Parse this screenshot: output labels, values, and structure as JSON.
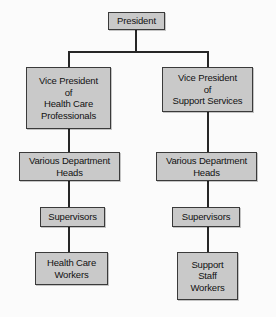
{
  "chart_title": "Organizational Chart",
  "diagram": {
    "type": "org-chart",
    "orientation": "top-down",
    "colors": {
      "background": "#fbfbfb",
      "node_fill": "#c9c9c9",
      "node_border": "#3a3a3a",
      "connector": "#262626",
      "text": "#111111"
    },
    "nodes": {
      "president": {
        "id": "president",
        "level": 0,
        "lines": [
          "President"
        ]
      },
      "vp_health": {
        "id": "vp-health-care-professionals",
        "level": 1,
        "branch": "left",
        "lines": [
          "Vice President",
          "of",
          "Health Care",
          "Professionals"
        ]
      },
      "vp_support": {
        "id": "vp-support-services",
        "level": 1,
        "branch": "right",
        "lines": [
          "Vice President",
          "of",
          "Support Services"
        ]
      },
      "dept_heads_left": {
        "id": "various-department-heads-left",
        "level": 2,
        "branch": "left",
        "lines": [
          "Various Department",
          "Heads"
        ]
      },
      "dept_heads_right": {
        "id": "various-department-heads-right",
        "level": 2,
        "branch": "right",
        "lines": [
          "Various Department",
          "Heads"
        ]
      },
      "supervisors_left": {
        "id": "supervisors-left",
        "level": 3,
        "branch": "left",
        "lines": [
          "Supervisors"
        ]
      },
      "supervisors_right": {
        "id": "supervisors-right",
        "level": 3,
        "branch": "right",
        "lines": [
          "Supervisors"
        ]
      },
      "workers_health": {
        "id": "health-care-workers",
        "level": 4,
        "branch": "left",
        "lines": [
          "Health Care",
          "Workers"
        ]
      },
      "workers_support": {
        "id": "support-staff-workers",
        "level": 4,
        "branch": "right",
        "lines": [
          "Support",
          "Staff",
          "Workers"
        ]
      }
    },
    "edges": [
      {
        "from": "president",
        "to": "vp_health"
      },
      {
        "from": "president",
        "to": "vp_support"
      },
      {
        "from": "vp_health",
        "to": "dept_heads_left"
      },
      {
        "from": "vp_support",
        "to": "dept_heads_right"
      },
      {
        "from": "dept_heads_left",
        "to": "supervisors_left"
      },
      {
        "from": "dept_heads_right",
        "to": "supervisors_right"
      },
      {
        "from": "supervisors_left",
        "to": "workers_health"
      },
      {
        "from": "supervisors_right",
        "to": "workers_support"
      }
    ]
  }
}
